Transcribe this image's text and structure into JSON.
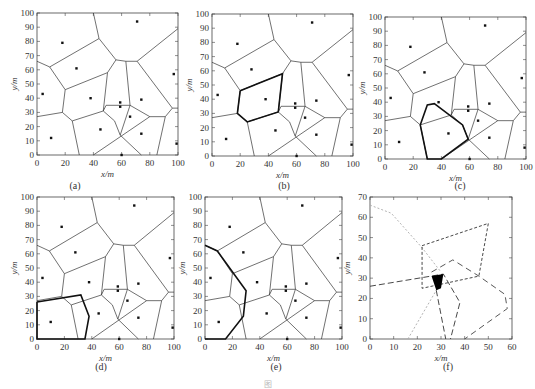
{
  "figure": {
    "caption": "图",
    "panels": [
      {
        "id": "a",
        "label": "(a)",
        "xlabel": "x/m",
        "ylabel": "y/m",
        "xticks": [
          "0",
          "20",
          "40",
          "60",
          "80",
          "100"
        ],
        "yticks": [
          "0",
          "10",
          "20",
          "30",
          "40",
          "50",
          "60",
          "70",
          "80",
          "90",
          "100"
        ]
      },
      {
        "id": "b",
        "label": "(b)",
        "xlabel": "x/m",
        "ylabel": "y/m",
        "xticks": [
          "0",
          "20",
          "40",
          "60",
          "80",
          "100"
        ],
        "yticks": [
          "0",
          "10",
          "20",
          "30",
          "40",
          "50",
          "60",
          "70",
          "80",
          "90",
          "100"
        ]
      },
      {
        "id": "c",
        "label": "(c)",
        "xlabel": "x/m",
        "ylabel": "y/m",
        "xticks": [
          "0",
          "20",
          "40",
          "60",
          "80",
          "100"
        ],
        "yticks": [
          "0",
          "10",
          "20",
          "30",
          "40",
          "50",
          "60",
          "70",
          "80",
          "90",
          "100"
        ]
      },
      {
        "id": "d",
        "label": "(d)",
        "xlabel": "x/m",
        "ylabel": "y/m",
        "xticks": [
          "0",
          "20",
          "40",
          "60",
          "80",
          "100"
        ],
        "yticks": [
          "0",
          "10",
          "20",
          "30",
          "40",
          "50",
          "60",
          "70",
          "80",
          "90",
          "100"
        ]
      },
      {
        "id": "e",
        "label": "(e)",
        "xlabel": "x/m",
        "ylabel": "y/m",
        "xticks": [
          "0",
          "20",
          "40",
          "60",
          "80",
          "100"
        ],
        "yticks": [
          "0",
          "10",
          "20",
          "30",
          "40",
          "50",
          "60",
          "70",
          "80",
          "90",
          "100"
        ]
      },
      {
        "id": "f",
        "label": "(f)",
        "xlabel": "x/m",
        "ylabel": "y/m",
        "xticks": [
          "0",
          "10",
          "20",
          "30",
          "40",
          "50",
          "60"
        ],
        "yticks": [
          "0",
          "10",
          "20",
          "30",
          "40",
          "50",
          "60",
          "70"
        ]
      }
    ]
  },
  "sensor_nodes": [
    [
      4,
      43
    ],
    [
      18,
      79
    ],
    [
      28,
      61
    ],
    [
      10,
      12
    ],
    [
      38,
      40
    ],
    [
      45,
      18
    ],
    [
      59,
      37
    ],
    [
      59,
      34
    ],
    [
      66,
      27
    ],
    [
      74,
      39
    ],
    [
      71,
      94
    ],
    [
      74,
      15
    ],
    [
      97,
      57
    ],
    [
      99,
      8
    ],
    [
      60,
      0
    ]
  ],
  "voronoi_edges": [
    [
      [
        0,
        66
      ],
      [
        9,
        62
      ]
    ],
    [
      [
        9,
        62
      ],
      [
        44,
        82
      ]
    ],
    [
      [
        44,
        82
      ],
      [
        40,
        100
      ]
    ],
    [
      [
        44,
        82
      ],
      [
        56,
        67
      ]
    ],
    [
      [
        56,
        67
      ],
      [
        63,
        66
      ]
    ],
    [
      [
        63,
        66
      ],
      [
        71,
        66
      ]
    ],
    [
      [
        71,
        66
      ],
      [
        100,
        89
      ]
    ],
    [
      [
        9,
        62
      ],
      [
        20,
        46
      ]
    ],
    [
      [
        20,
        46
      ],
      [
        50,
        58
      ]
    ],
    [
      [
        50,
        58
      ],
      [
        56,
        67
      ]
    ],
    [
      [
        20,
        46
      ],
      [
        18,
        30
      ]
    ],
    [
      [
        0,
        27
      ],
      [
        18,
        30
      ]
    ],
    [
      [
        18,
        30
      ],
      [
        25,
        24
      ]
    ],
    [
      [
        25,
        24
      ],
      [
        47,
        31
      ]
    ],
    [
      [
        47,
        31
      ],
      [
        50,
        58
      ]
    ],
    [
      [
        47,
        31
      ],
      [
        55,
        24
      ]
    ],
    [
      [
        25,
        24
      ],
      [
        30,
        0
      ]
    ],
    [
      [
        55,
        24
      ],
      [
        59,
        14
      ]
    ],
    [
      [
        59,
        14
      ],
      [
        74,
        0
      ]
    ],
    [
      [
        40,
        0
      ],
      [
        80,
        27
      ]
    ],
    [
      [
        63,
        66
      ],
      [
        66,
        35
      ]
    ],
    [
      [
        49,
        35
      ],
      [
        66,
        35
      ]
    ],
    [
      [
        66,
        35
      ],
      [
        80,
        27
      ]
    ],
    [
      [
        66,
        35
      ],
      [
        59,
        14
      ]
    ],
    [
      [
        80,
        27
      ],
      [
        91,
        27
      ]
    ],
    [
      [
        91,
        27
      ],
      [
        85,
        0
      ]
    ],
    [
      [
        91,
        27
      ],
      [
        96,
        33
      ]
    ],
    [
      [
        96,
        33
      ],
      [
        100,
        33
      ]
    ],
    [
      [
        71,
        66
      ],
      [
        96,
        33
      ]
    ],
    [
      [
        49,
        35
      ],
      [
        47,
        31
      ]
    ]
  ],
  "panel_f": {
    "xlim": [
      0,
      60
    ],
    "ylim": [
      0,
      70
    ],
    "highlight_polygon": [
      [
        26,
        31
      ],
      [
        31,
        32
      ],
      [
        30,
        25
      ],
      [
        28,
        24
      ]
    ],
    "highlight_color": "#000000"
  }
}
